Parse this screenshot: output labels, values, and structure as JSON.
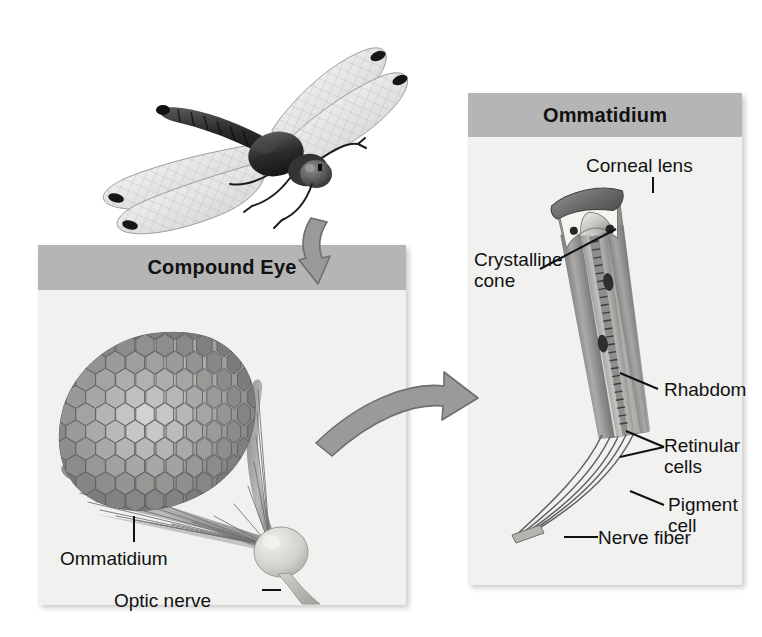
{
  "figure": {
    "background_color": "#ffffff",
    "panel_background": "#f1f1ef",
    "header_band_color": "#b5b5b5",
    "label_color": "#111111",
    "arrow_fill": "#9a9a9a",
    "arrow_stroke": "#6e6e6e"
  },
  "specimen": {
    "name": "dragonfly-illustration",
    "caption": ""
  },
  "panels": [
    {
      "id": "compound-eye",
      "title": "Compound Eye",
      "labels": [
        {
          "id": "ommatidium",
          "text": "Ommatidium"
        },
        {
          "id": "optic-nerve",
          "text": "Optic nerve"
        }
      ]
    },
    {
      "id": "ommatidium",
      "title": "Ommatidium",
      "labels": [
        {
          "id": "corneal-lens",
          "text": "Corneal lens"
        },
        {
          "id": "crystalline-cone-line1",
          "text": "Crystalline"
        },
        {
          "id": "crystalline-cone-line2",
          "text": "cone"
        },
        {
          "id": "rhabdom",
          "text": "Rhabdom"
        },
        {
          "id": "retinular-cells-line1",
          "text": "Retinular"
        },
        {
          "id": "retinular-cells-line2",
          "text": "cells"
        },
        {
          "id": "pigment-cell-line1",
          "text": "Pigment"
        },
        {
          "id": "pigment-cell-line2",
          "text": "cell"
        },
        {
          "id": "nerve-fiber",
          "text": "Nerve fiber"
        }
      ]
    }
  ],
  "connectors": [
    {
      "id": "dragonfly-to-compound-eye",
      "shape": "curved-arrow-down"
    },
    {
      "id": "compound-eye-to-ommatidium",
      "shape": "curved-arrow-right"
    }
  ]
}
